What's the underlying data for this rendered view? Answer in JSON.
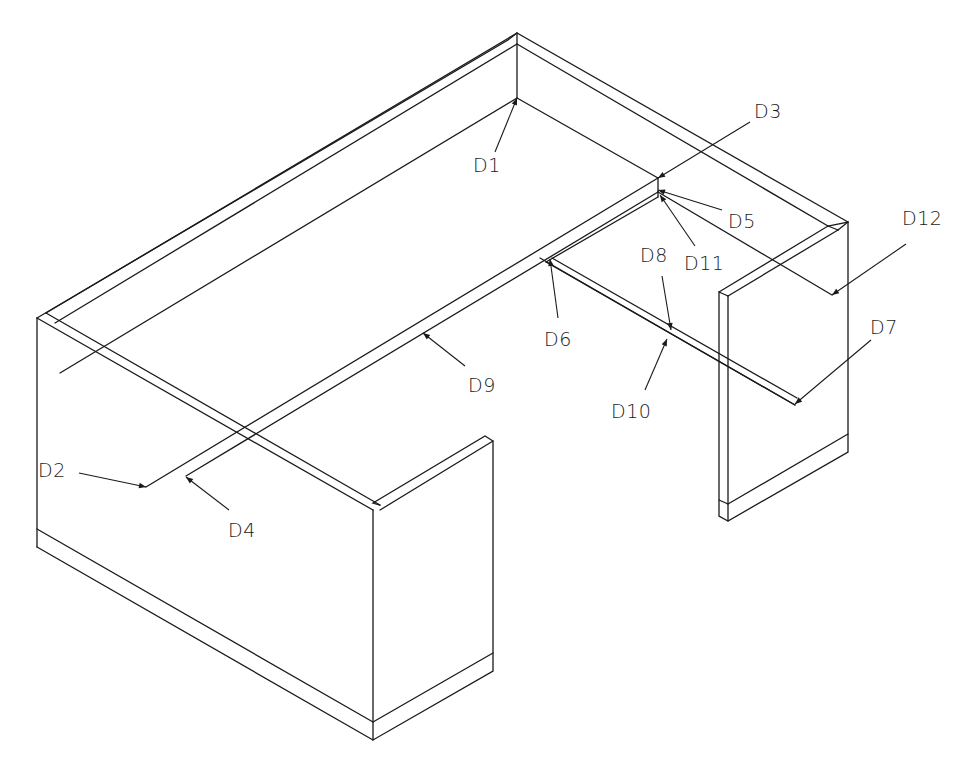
{
  "colors": {
    "line": "#1a1a1a",
    "background": "#ffffff"
  },
  "labels": {
    "D1": "D1",
    "D2": "D2",
    "D3": "D3",
    "D4": "D4",
    "D5": "D5",
    "D6": "D6",
    "D7": "D7",
    "D8": "D8",
    "D9": "D9",
    "D10": "D10",
    "D11": "D11",
    "D12": "D12"
  }
}
